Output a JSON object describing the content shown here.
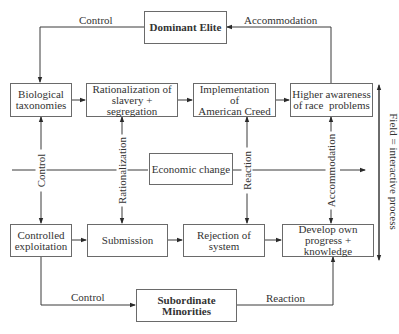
{
  "diagram": {
    "nodes": {
      "dominant_elite": "Dominant Elite",
      "biological_taxonomies": [
        "Biological",
        "taxonomies"
      ],
      "rationalization": [
        "Rationalization of",
        "slavery + segregation"
      ],
      "implementation": [
        "Implementation of",
        "American Creed"
      ],
      "higher_awareness": [
        "Higher awareness",
        "of race  problems"
      ],
      "economic_change": "Economic change",
      "controlled_exploitation": [
        "Controlled",
        "exploitation"
      ],
      "submission": "Submission",
      "rejection": [
        "Rejection of",
        "system"
      ],
      "develop_own": [
        "Develop own",
        "progress + knowledge"
      ],
      "subordinate_minorities": "Subordinate Minorities"
    },
    "edge_labels": {
      "top_left_control": "Control",
      "top_right_accommodation": "Accommodation",
      "vertical_control": "Control",
      "vertical_rationalization": "Rationalization",
      "vertical_reaction": "Reaction",
      "vertical_accommodation": "Accommodation",
      "bottom_left_control": "Control",
      "bottom_right_reaction": "Reaction",
      "field": "Field = interactive process"
    },
    "colors": {
      "line": "#3a3a3a",
      "border": "#6a6a6a",
      "text": "#333333"
    }
  }
}
